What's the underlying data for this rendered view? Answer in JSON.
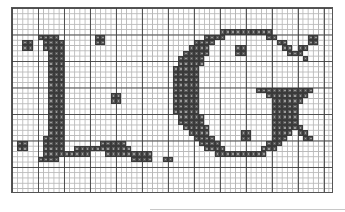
{
  "chart_data": {
    "type": "heatmap",
    "title": "Cross-stitch chart: letters L . G",
    "letters": [
      "L",
      ".",
      "G"
    ],
    "grid": {
      "cols": 62,
      "rows": 35,
      "major_every": 5
    },
    "colors": {
      "stitch": "#5a5a5a",
      "stitch_border": "#3a3a3a",
      "grid_minor": "#b8b8b8",
      "grid_major": "#3c3c3c",
      "background": "#ffffff"
    },
    "rows": [
      "..............................................................",
      "..............................................................",
      "..............................................................",
      "..............................................................",
      "........................................XXXXXXXXXX............",
      ".....XXXX.......XX...................XXXX........XX......XX...",
      "..XX..XXXX......XX.................XXXX............XX....XX...",
      "..XX..XXXX........................XXXX.....XX.......XX.XX.....",
      ".......XXX.......................XXXXX.....XX........XXX......",
      ".......XXX......................XXXXX...................X.....",
      ".......XXX......................XXXXX.........................",
      ".......XXX.....................XXXXX..........................",
      ".......XXX.....................XXXXX..........................",
      ".......XXX.....................XXXXX..........................",
      ".......XXX.....................XXXXX..........................",
      ".......XXX.....................XXXXX...........XXXXXXXXXXX....",
      ".......XXX.........XX..........XXXXX.............XXXXXXXX.....",
      ".......XXX.........XX..........XXXXX..............XXXXXX......",
      ".......XXX.....................XXXXX..............XXXXX.......",
      ".......XXX.....................XXXXX..............XXXXX.......",
      ".......XXX......................XXXXX.............XXXXX.......",
      ".......XXX......................XXXXX.............XXXXX.......",
      ".......XXX.......................XXXXX............XXXXXX......",
      ".......XXX........................XXXX......XX....XXXX.XX.....",
      "......XXXX.........................XXXX.....XX....XXX...XX....",
      ".XX...XXXX.......XXXXX..............XXXX.........XXX..........",
      ".XX...XXXX..XXXXXXXXXXX..............XXXX.......XXX...........",
      "......XXXXXXXXX...XXXXXXXXX............XXXXXXXXXX.............",
      ".....XXXX..............XXXX..XX...............................",
      "..............................................................",
      "..............................................................",
      "..............................................................",
      "..............................................................",
      "..............................................................",
      ".............................................................."
    ]
  }
}
